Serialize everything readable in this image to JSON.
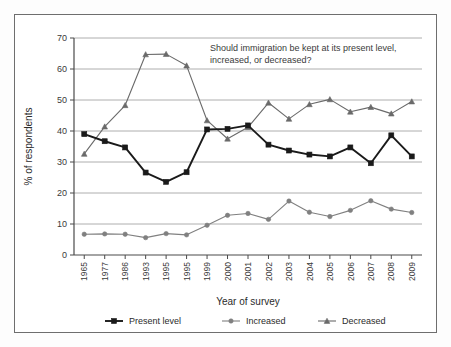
{
  "chart_data": {
    "type": "line",
    "title": "",
    "annotation": "Should immigration be kept at its present level, increased, or decreased?",
    "xlabel": "Year of survey",
    "ylabel": "% of respondents",
    "ylim": [
      0,
      70
    ],
    "yticks": [
      0,
      10,
      20,
      30,
      40,
      50,
      60,
      70
    ],
    "grid": true,
    "legend_position": "bottom",
    "categories": [
      "1965",
      "1977",
      "1986",
      "1993",
      "1995",
      "1995",
      "1999",
      "2000",
      "2001",
      "2002",
      "2003",
      "2004",
      "2005",
      "2006",
      "2007",
      "2008",
      "2009"
    ],
    "series": [
      {
        "name": "Present level",
        "marker": "square",
        "color": "#1a1a1a",
        "values": [
          39.0,
          36.7,
          34.7,
          26.6,
          23.6,
          26.7,
          40.5,
          40.7,
          41.8,
          35.6,
          33.7,
          32.4,
          31.8,
          34.7,
          29.6,
          38.6,
          31.8
        ]
      },
      {
        "name": "Increased",
        "marker": "circle",
        "color": "#808080",
        "values": [
          6.7,
          6.8,
          6.7,
          5.6,
          6.9,
          6.5,
          9.6,
          12.8,
          13.4,
          11.5,
          17.4,
          13.8,
          12.4,
          14.4,
          17.5,
          14.8,
          13.7
        ]
      },
      {
        "name": "Decreased",
        "marker": "triangle",
        "color": "#6a6a6a",
        "values": [
          32.6,
          41.4,
          48.3,
          64.7,
          64.8,
          61.1,
          43.4,
          37.5,
          41.2,
          49.1,
          43.9,
          48.6,
          50.2,
          46.2,
          47.7,
          45.6,
          49.5
        ]
      }
    ]
  },
  "axes": {
    "y_title": "% of respondents",
    "x_title": "Year of survey",
    "y_tick_labels": [
      "70",
      "60",
      "50",
      "40",
      "30",
      "20",
      "10",
      "0"
    ],
    "x_tick_labels": [
      "1965",
      "1977",
      "1986",
      "1993",
      "1995",
      "1995",
      "1999",
      "2000",
      "2001",
      "2002",
      "2003",
      "2004",
      "2005",
      "2006",
      "2007",
      "2008",
      "2009"
    ]
  },
  "annotation": {
    "line1": "Should immigration be kept at its present level,",
    "line2": "increased, or decreased?"
  },
  "legend": {
    "items": [
      {
        "label": "Present level",
        "marker": "square-marker",
        "color": "#1a1a1a"
      },
      {
        "label": "Increased",
        "marker": "circle-marker",
        "color": "#808080"
      },
      {
        "label": "Decreased",
        "marker": "triangle-marker",
        "color": "#6a6a6a"
      }
    ]
  },
  "colors": {
    "frame": "#6e6e6e",
    "grid": "#9a9a9a",
    "axis": "#4a4a4a",
    "text": "#2b2b2b",
    "background": "#ffffff"
  }
}
